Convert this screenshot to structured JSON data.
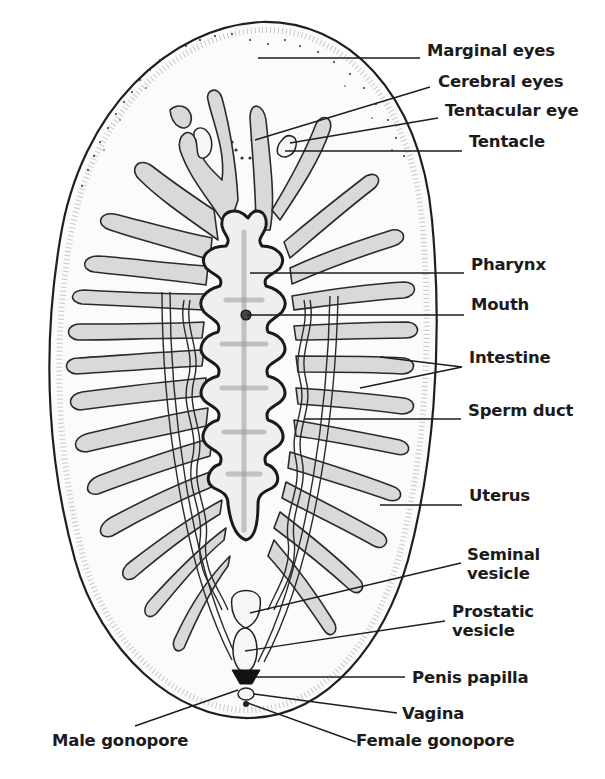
{
  "figure": {
    "colors": {
      "background": "#ffffff",
      "ink": "#1b1b1b",
      "stipple": "#d9d9d9"
    }
  },
  "labels": [
    {
      "id": "marginal-eyes",
      "text": "Marginal eyes",
      "x": 427,
      "y": 49,
      "leader": [
        [
          258,
          58
        ],
        [
          420,
          58
        ]
      ]
    },
    {
      "id": "cerebral-eyes",
      "text": "Cerebral eyes",
      "x": 438,
      "y": 80,
      "leader": [
        [
          255,
          140
        ],
        [
          430,
          87
        ]
      ]
    },
    {
      "id": "tentacular-eye",
      "text": "Tentacular eye",
      "x": 445,
      "y": 109,
      "leader": [
        [
          290,
          143
        ],
        [
          438,
          118
        ]
      ]
    },
    {
      "id": "tentacle",
      "text": "Tentacle",
      "x": 469,
      "y": 140,
      "leader": [
        [
          285,
          151
        ],
        [
          462,
          151
        ]
      ]
    },
    {
      "id": "pharynx",
      "text": "Pharynx",
      "x": 471,
      "y": 263,
      "leader": [
        [
          250,
          273
        ],
        [
          464,
          273
        ]
      ]
    },
    {
      "id": "mouth",
      "text": "Mouth",
      "x": 471,
      "y": 303,
      "leader": [
        [
          247,
          315
        ],
        [
          464,
          315
        ]
      ]
    },
    {
      "id": "intestine",
      "text": "Intestine",
      "x": 469,
      "y": 356,
      "leader": [
        [
          380,
          357
        ],
        [
          462,
          367
        ],
        [
          360,
          388
        ]
      ]
    },
    {
      "id": "sperm-duct",
      "text": "Sperm duct",
      "x": 468,
      "y": 409,
      "leader": [
        [
          305,
          419
        ],
        [
          461,
          419
        ]
      ]
    },
    {
      "id": "uterus",
      "text": "Uterus",
      "x": 469,
      "y": 494,
      "leader": [
        [
          380,
          505
        ],
        [
          462,
          505
        ]
      ]
    },
    {
      "id": "seminal-vesicle",
      "text": "Seminal\nvesicle",
      "lines": [
        "Seminal",
        "vesicle"
      ],
      "x": 467,
      "y": 553,
      "leader": [
        [
          250,
          613
        ],
        [
          461,
          563
        ]
      ]
    },
    {
      "id": "prostatic-vesicle",
      "text": "Prostatic\nvesicle",
      "lines": [
        "Prostatic",
        "vesicle"
      ],
      "x": 452,
      "y": 610,
      "leader": [
        [
          245,
          651
        ],
        [
          445,
          621
        ]
      ]
    },
    {
      "id": "penis-papilla",
      "text": "Penis papilla",
      "x": 412,
      "y": 666,
      "leader": [
        [
          255,
          677
        ],
        [
          405,
          677
        ]
      ]
    },
    {
      "id": "vagina",
      "text": "Vagina",
      "x": 402,
      "y": 701,
      "leader": [
        [
          254,
          694
        ],
        [
          397,
          713
        ]
      ]
    },
    {
      "id": "male-gonopore",
      "text": "Male gonopore",
      "x": 52,
      "y": 735,
      "leader": [
        [
          238,
          690
        ],
        [
          135,
          726
        ]
      ]
    },
    {
      "id": "female-gonopore",
      "text": "Female gonopore",
      "x": 356,
      "y": 735,
      "leader": [
        [
          245,
          702
        ],
        [
          356,
          742
        ]
      ]
    }
  ]
}
